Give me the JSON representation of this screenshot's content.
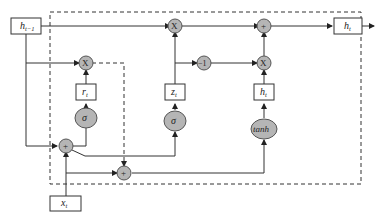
{
  "diagram": {
    "type": "GRU cell",
    "inputs": {
      "prev_hidden": {
        "label": "h",
        "sub": "t−1"
      },
      "input": {
        "label": "x",
        "sub": "t"
      }
    },
    "output": {
      "label": "h",
      "sub": "t"
    },
    "gates": {
      "reset": {
        "label": "r",
        "sub": "t",
        "activation": "σ"
      },
      "update": {
        "label": "z",
        "sub": "t",
        "activation": "σ"
      },
      "candidate": {
        "label": "h",
        "sub": "t",
        "activation": "tanh"
      }
    },
    "operators": {
      "multiply": "X",
      "add": "+",
      "one_minus": "−1"
    },
    "colors": {
      "node_fill": "#b5b5b5",
      "line": "#333333",
      "background": "#ffffff"
    }
  }
}
